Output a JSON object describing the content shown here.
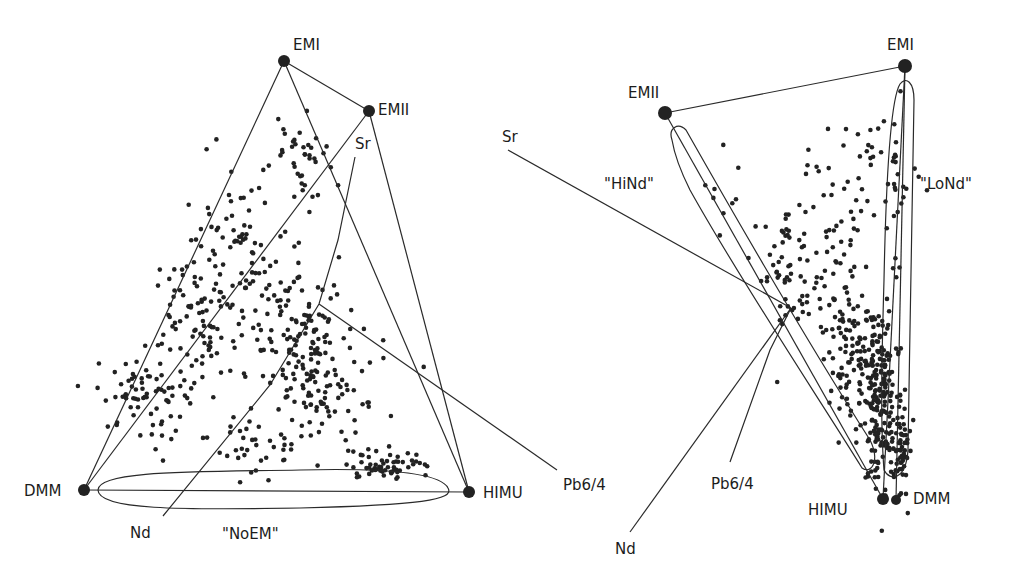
{
  "colors": {
    "ink": "#222222",
    "background": "#ffffff"
  },
  "left_panel": {
    "endmembers": [
      {
        "id": "EMI",
        "label": "EMI",
        "x": 284,
        "y": 61,
        "lx": 293,
        "ly": 40
      },
      {
        "id": "EMII",
        "label": "EMII",
        "x": 369,
        "y": 111,
        "lx": 380,
        "ly": 103
      },
      {
        "id": "DMM",
        "label": "DMM",
        "x": 84,
        "y": 490,
        "lx": 24,
        "ly": 486
      },
      {
        "id": "HIMU",
        "label": "HIMU",
        "x": 469,
        "y": 492,
        "lx": 484,
        "ly": 487
      }
    ],
    "isotope_axes": [
      {
        "id": "Sr",
        "label": "Sr",
        "lx": 355,
        "ly": 137
      },
      {
        "id": "Nd",
        "label": "Nd",
        "lx": 130,
        "ly": 527
      },
      {
        "id": "Pb64",
        "label": "Pb6/4",
        "lx": 564,
        "ly": 478
      }
    ],
    "fields": [
      {
        "id": "NoEM",
        "label": "\"NoEM\"",
        "lx": 223,
        "ly": 527
      }
    ]
  },
  "right_panel": {
    "endmembers": [
      {
        "id": "EMI",
        "label": "EMI",
        "x": 905,
        "y": 66,
        "lx": 888,
        "ly": 40
      },
      {
        "id": "EMII",
        "label": "EMII",
        "x": 665,
        "y": 113,
        "lx": 628,
        "ly": 88
      },
      {
        "id": "HIMU",
        "label": "HIMU",
        "x": 883,
        "y": 499,
        "lx": 808,
        "ly": 505
      },
      {
        "id": "DMM",
        "label": "DMM",
        "x": 896,
        "y": 500,
        "lx": 914,
        "ly": 492
      }
    ],
    "isotope_axes": [
      {
        "id": "Sr",
        "label": "Sr",
        "lx": 502,
        "ly": 130
      },
      {
        "id": "Nd",
        "label": "Nd",
        "lx": 615,
        "ly": 543
      },
      {
        "id": "Pb64",
        "label": "Pb6/4",
        "lx": 712,
        "ly": 478
      }
    ],
    "fields": [
      {
        "id": "HiNd",
        "label": "\"HiNd\"",
        "lx": 605,
        "ly": 178
      },
      {
        "id": "LoNd",
        "label": "\"LoNd\"",
        "lx": 921,
        "ly": 178
      }
    ]
  },
  "scatter": {
    "left": {
      "count": 560,
      "seed": 7,
      "clusters": [
        [
          230,
          240,
          40,
          60,
          70
        ],
        [
          300,
          330,
          45,
          55,
          130
        ],
        [
          200,
          320,
          40,
          55,
          90
        ],
        [
          150,
          400,
          40,
          40,
          70
        ],
        [
          330,
          400,
          50,
          40,
          70
        ],
        [
          390,
          465,
          35,
          12,
          60
        ],
        [
          300,
          160,
          25,
          45,
          40
        ],
        [
          250,
          440,
          55,
          30,
          40
        ]
      ]
    },
    "right": {
      "count": 520,
      "seed": 11,
      "clusters": [
        [
          880,
          400,
          14,
          80,
          190
        ],
        [
          850,
          350,
          22,
          60,
          110
        ],
        [
          820,
          260,
          40,
          70,
          60
        ],
        [
          900,
          450,
          10,
          40,
          60
        ],
        [
          780,
          280,
          20,
          50,
          30
        ],
        [
          860,
          170,
          40,
          50,
          40
        ],
        [
          720,
          200,
          25,
          40,
          10
        ],
        [
          895,
          200,
          8,
          80,
          20
        ]
      ]
    }
  }
}
